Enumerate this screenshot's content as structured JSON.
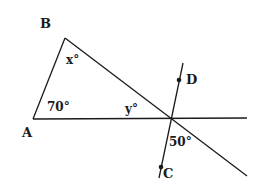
{
  "diagram": {
    "points": {
      "A": {
        "label": "A",
        "x": 33,
        "y": 119
      },
      "B": {
        "label": "B",
        "x": 65,
        "y": 38
      },
      "C": {
        "label": "C",
        "x": 161,
        "y": 167
      },
      "D": {
        "label": "D",
        "x": 179,
        "y": 79
      }
    },
    "angles": {
      "at_A": "70°",
      "at_B": "x°",
      "y_angle": "y°",
      "lower_angle": "50°"
    },
    "colors": {
      "stroke": "#1a1a1a",
      "background": "#ffffff"
    }
  }
}
